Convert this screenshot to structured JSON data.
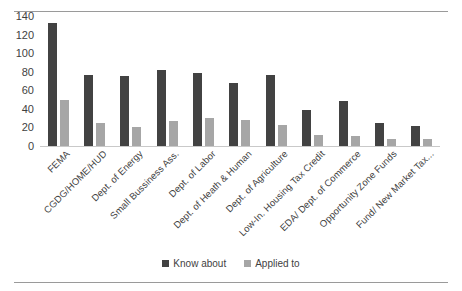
{
  "chart_data": {
    "type": "bar",
    "title": "",
    "subtitle": "",
    "xlabel": "",
    "ylabel": "",
    "ylim": [
      0,
      140
    ],
    "yticks": [
      0,
      20,
      40,
      60,
      80,
      100,
      120,
      140
    ],
    "grid": false,
    "legend_position": "bottom",
    "categories": [
      "FEMA",
      "CGDG/HOME/HUD",
      "Dept. of Energy",
      "Small Bussiness Ass.",
      "Dept. of Labor",
      "Dept. of Heath & Human",
      "Dept. of Agriculture",
      "Low-In. Housing Tax Credit",
      "EDA/ Dept. of Commerce",
      "Opportunity Zone Funds",
      "Fund/ New Market Tax..."
    ],
    "series": [
      {
        "name": "Know about",
        "color": "#424242",
        "values": [
          133,
          76,
          75,
          82,
          79,
          68,
          76,
          39,
          48,
          25,
          22
        ]
      },
      {
        "name": "Applied to",
        "color": "#a6a6a6",
        "values": [
          50,
          25,
          20,
          27,
          30,
          28,
          23,
          12,
          11,
          8,
          8
        ]
      }
    ]
  },
  "figure": {
    "background": "#ffffff",
    "rule_color": "#9a9a9a",
    "axis_color": "#c9c9c9",
    "text_color": "#3f3f3f"
  }
}
